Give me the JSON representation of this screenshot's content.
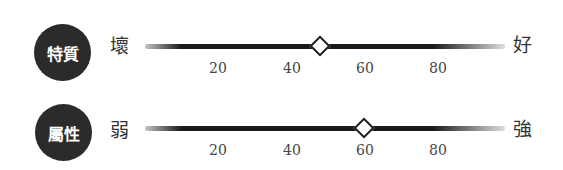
{
  "scales": [
    {
      "name": "特質",
      "low_label": "壞",
      "high_label": "好",
      "value": 48
    },
    {
      "name": "屬性",
      "low_label": "弱",
      "high_label": "強",
      "value": 60
    }
  ],
  "ticks": [
    "20",
    "40",
    "60",
    "80"
  ],
  "colors": {
    "badge": "#2b2b2b",
    "track": "#1a1a1a",
    "marker_fill": "#ffffff"
  }
}
